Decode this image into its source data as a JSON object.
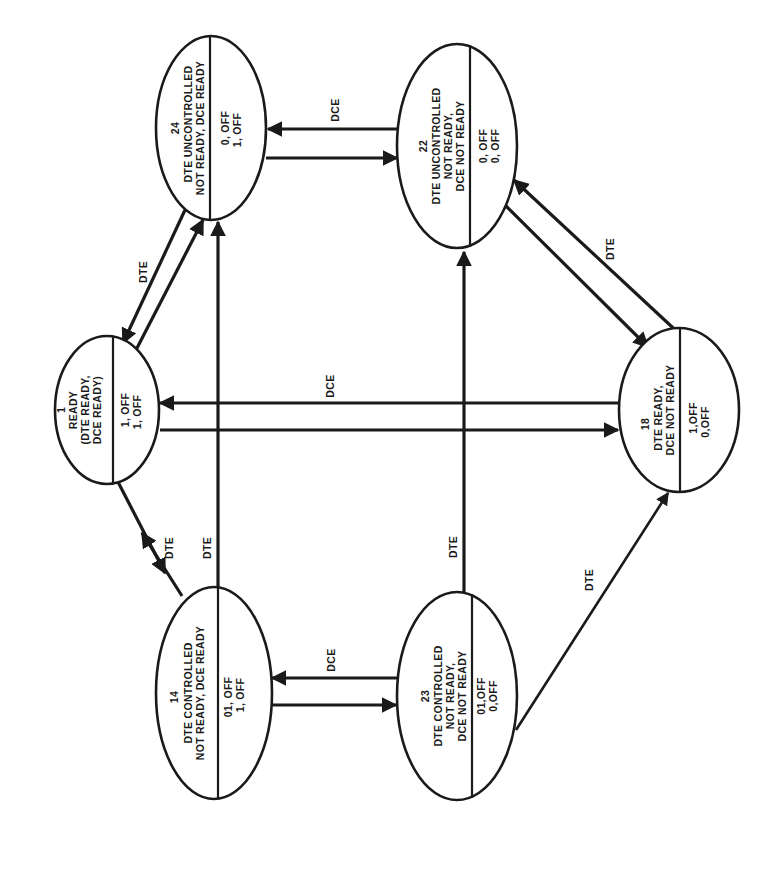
{
  "diagram": {
    "orientation": "rotated 90 degrees counter-clockwise",
    "colors": {
      "ink": "#1a1a1a",
      "background": "#ffffff"
    },
    "states": [
      {
        "id": "1",
        "number": "1",
        "title_lines": [
          "READY",
          "(DTE READY,",
          "DCE READY)"
        ],
        "signals": [
          "1, OFF",
          "1, OFF"
        ],
        "center": [
          107,
          410
        ],
        "rx": 52,
        "ry": 74,
        "divider_x": 113
      },
      {
        "id": "24",
        "number": "24",
        "title_lines": [
          "DTE UNCONTROLLED",
          "NOT READY, DCE READY"
        ],
        "signals": [
          "0, OFF",
          "1, OFF"
        ],
        "center": [
          211,
          128
        ],
        "rx": 55,
        "ry": 92,
        "divider_x": 210
      },
      {
        "id": "22",
        "number": "22",
        "title_lines": [
          "DTE UNCONTROLLED",
          "NOT READY,",
          "DCE NOT READY"
        ],
        "signals": [
          "0, OFF",
          "0, OFF"
        ],
        "center": [
          457,
          146
        ],
        "rx": 60,
        "ry": 102,
        "divider_x": 470
      },
      {
        "id": "18",
        "number": "18",
        "title_lines": [
          "DTE READY,",
          "DCE NOT READY"
        ],
        "signals": [
          "1,OFF",
          "0,OFF"
        ],
        "center": [
          679,
          410
        ],
        "rx": 60,
        "ry": 82,
        "divider_x": 680
      },
      {
        "id": "14",
        "number": "14",
        "title_lines": [
          "DTE CONTROLLED",
          "NOT READY, DCE READY"
        ],
        "signals": [
          "01, OFF",
          "1, OFF"
        ],
        "center": [
          214,
          693
        ],
        "rx": 58,
        "ry": 106,
        "divider_x": 218
      },
      {
        "id": "23",
        "number": "23",
        "title_lines": [
          "DTE CONTROLLED",
          "NOT READY,",
          "DCE NOT READY"
        ],
        "signals": [
          "01,OFF",
          "0,OFF"
        ],
        "center": [
          457,
          696
        ],
        "rx": 60,
        "ry": 104,
        "divider_x": 472
      }
    ],
    "transitions": [
      {
        "from": "1",
        "to": "24",
        "label": "DTE"
      },
      {
        "from": "24",
        "to": "1",
        "label": ""
      },
      {
        "from": "24",
        "to": "22",
        "label": ""
      },
      {
        "from": "22",
        "to": "24",
        "label": "DCE"
      },
      {
        "from": "22",
        "to": "18",
        "label": ""
      },
      {
        "from": "18",
        "to": "22",
        "label": "DTE"
      },
      {
        "from": "1",
        "to": "18",
        "label": ""
      },
      {
        "from": "18",
        "to": "1",
        "label": "DCE"
      },
      {
        "from": "1",
        "to": "14",
        "label": ""
      },
      {
        "from": "14",
        "to": "1",
        "label": "DTE"
      },
      {
        "from": "14",
        "to": "24",
        "label": "DTE"
      },
      {
        "from": "14",
        "to": "23",
        "label": ""
      },
      {
        "from": "23",
        "to": "14",
        "label": "DCE"
      },
      {
        "from": "23",
        "to": "22",
        "label": "DTE"
      },
      {
        "from": "23",
        "to": "18",
        "label": "DTE"
      }
    ],
    "edge_labels": {
      "e_1_24": "DTE",
      "e_22_24": "DCE",
      "e_18_22": "DTE",
      "e_18_1": "DCE",
      "e_14_1": "DTE",
      "e_14_24": "DTE",
      "e_23_14": "DCE",
      "e_23_22": "DTE",
      "e_23_18": "DTE"
    }
  }
}
